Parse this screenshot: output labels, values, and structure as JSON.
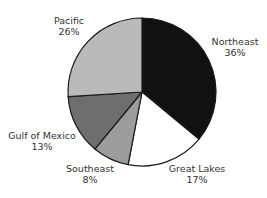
{
  "chart_data": {
    "type": "pie",
    "title": "",
    "start_angle_deg": 0,
    "direction": "clockwise",
    "categories": [
      "Northeast",
      "Great Lakes",
      "Southeast",
      "Gulf of Mexico",
      "Pacific"
    ],
    "values": [
      36,
      17,
      8,
      13,
      26
    ],
    "unit": "%",
    "colors": [
      "#111111",
      "#ffffff",
      "#9c9c9c",
      "#6e6e6e",
      "#bababa"
    ],
    "slices": [
      {
        "name": "Northeast",
        "value": 36,
        "label": "Northeast",
        "pct": "36%",
        "color": "#111111"
      },
      {
        "name": "Great Lakes",
        "value": 17,
        "label": "Great Lakes",
        "pct": "17%",
        "color": "#ffffff"
      },
      {
        "name": "Southeast",
        "value": 8,
        "label": "Southeast",
        "pct": "8%",
        "color": "#9c9c9c"
      },
      {
        "name": "Gulf of Mexico",
        "value": 13,
        "label": "Gulf of Mexico",
        "pct": "13%",
        "color": "#6e6e6e"
      },
      {
        "name": "Pacific",
        "value": 26,
        "label": "Pacific",
        "pct": "26%",
        "color": "#bababa"
      }
    ],
    "legend": "none (labels placed outside slices)"
  },
  "labels": {
    "northeast": {
      "name": "Northeast",
      "pct": "36%"
    },
    "great_lakes": {
      "name": "Great Lakes",
      "pct": "17%"
    },
    "southeast": {
      "name": "Southeast",
      "pct": "8%"
    },
    "gulf_of_mexico": {
      "name": "Gulf of Mexico",
      "pct": "13%"
    },
    "pacific": {
      "name": "Pacific",
      "pct": "26%"
    }
  }
}
